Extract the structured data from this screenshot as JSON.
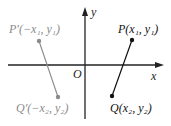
{
  "diagram": {
    "type": "coordinate-reflection",
    "axes": {
      "x_label": "x",
      "y_label": "y",
      "origin_label": "O"
    },
    "points": [
      {
        "id": "P",
        "label": "P(x₁, y₁)",
        "color": "#111111"
      },
      {
        "id": "Q",
        "label": "Q(x₂, y₂)",
        "color": "#111111"
      },
      {
        "id": "P_prime",
        "label": "P′(−x₁, y₁)",
        "color": "#8a8a8a"
      },
      {
        "id": "Q_prime",
        "label": "Q′(−x₂, y₂)",
        "color": "#8a8a8a"
      }
    ],
    "segments": [
      {
        "from": "P",
        "to": "Q",
        "color": "#111111"
      },
      {
        "from": "P_prime",
        "to": "Q_prime",
        "color": "#8a8a8a"
      }
    ]
  }
}
